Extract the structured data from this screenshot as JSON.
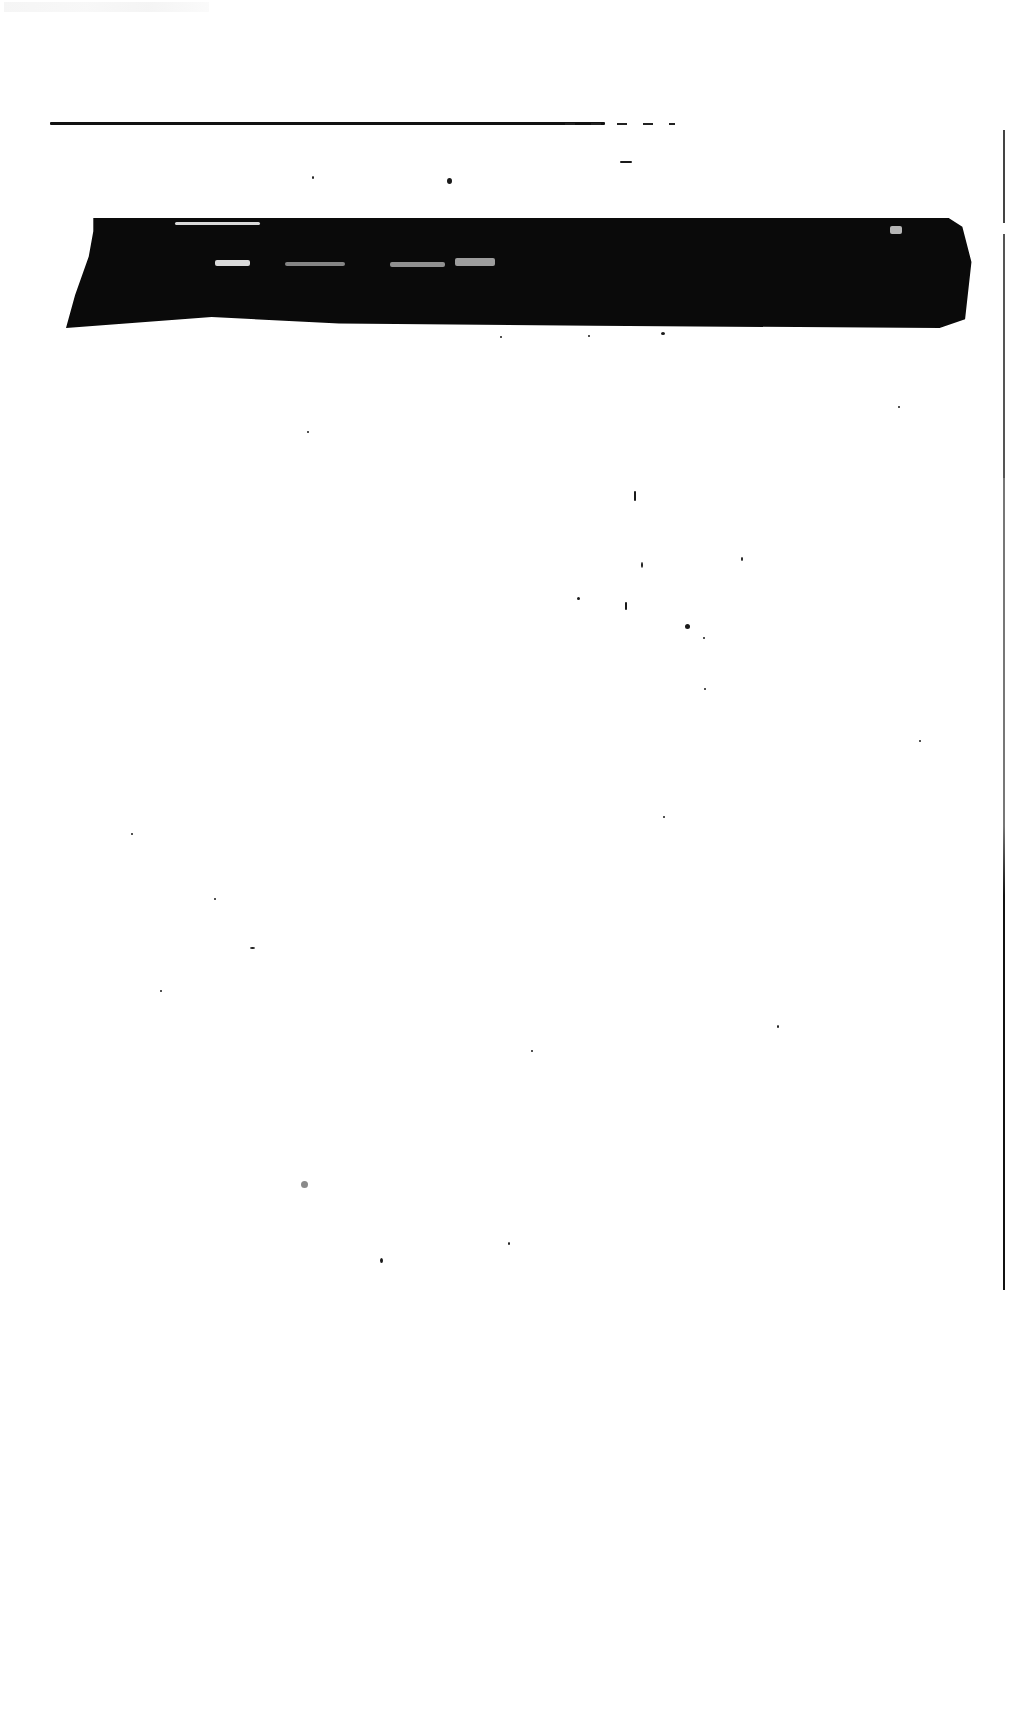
{
  "document": {
    "type": "scanned-page",
    "header_text": "",
    "body_text": "",
    "regions": {
      "top_rule": {
        "visible": true
      },
      "redacted_band": {
        "visible": true,
        "legible_text": ""
      },
      "right_margin_line": {
        "visible": true
      }
    }
  },
  "colors": {
    "paper": "#ffffff",
    "ink": "#0a0a0a"
  }
}
